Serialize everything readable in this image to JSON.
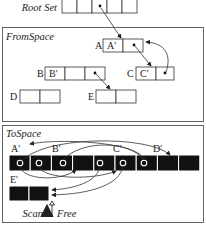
{
  "root_set": {
    "label": "Root Set",
    "cell_count": 5,
    "pointer_cell": 3
  },
  "from_space": {
    "title": "FromSpace",
    "objects": [
      {
        "name": "A",
        "cells": [
          "A'",
          ""
        ],
        "pointer_cells": [
          2
        ]
      },
      {
        "name": "B",
        "cells": [
          "B'",
          "",
          ""
        ],
        "pointer_cells": [
          3
        ]
      },
      {
        "name": "C",
        "cells": [
          "C'",
          ""
        ],
        "pointer_cells": [
          2
        ]
      },
      {
        "name": "D",
        "cells": [
          "",
          ""
        ],
        "pointer_cells": []
      },
      {
        "name": "E",
        "cells": [
          "",
          ""
        ],
        "pointer_cells": []
      }
    ],
    "edges": [
      {
        "from": "root_set.cell3",
        "to": "A"
      },
      {
        "from": "A.cell2",
        "to": "C"
      },
      {
        "from": "C.cell2",
        "to": "A"
      },
      {
        "from": "B.cell3",
        "to": "E"
      }
    ]
  },
  "to_space": {
    "title": "ToSpace",
    "row_labels": [
      "A'",
      "B'",
      "C'",
      "D'"
    ],
    "row_cell_count": 9,
    "second_row_label": "E'",
    "second_row_cell_count": 2,
    "scan_label": "Scan",
    "free_label": "Free"
  }
}
